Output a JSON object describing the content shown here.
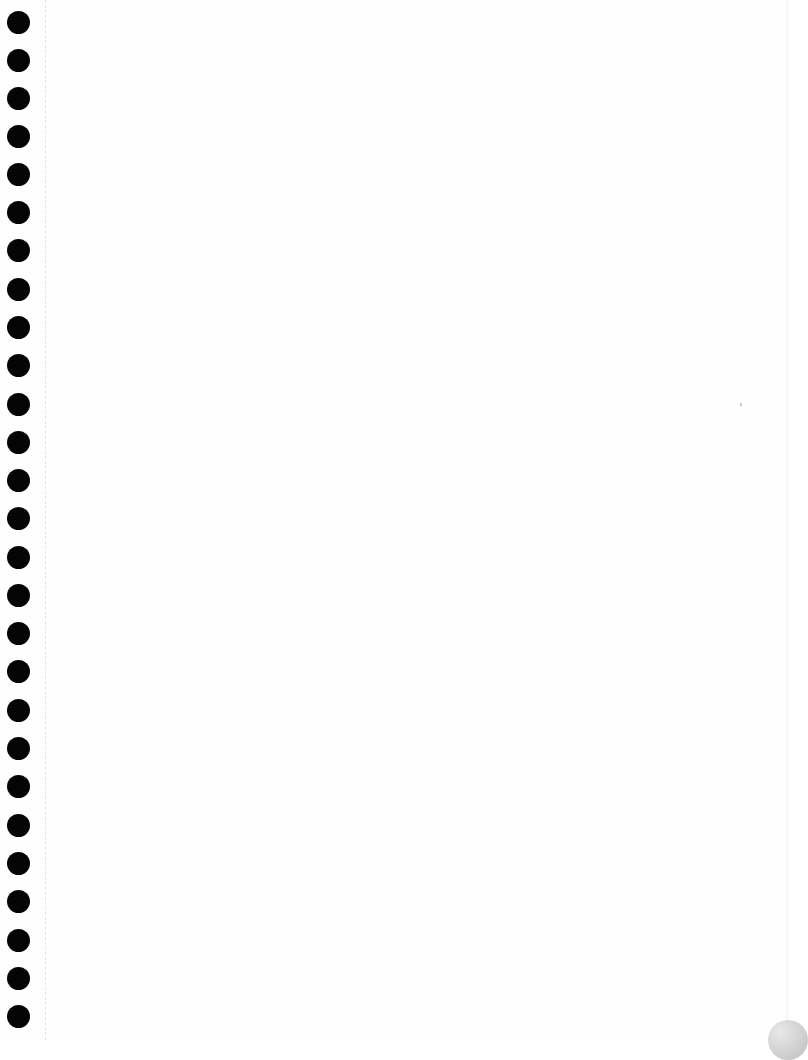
{
  "page": {
    "type": "blank notebook page",
    "background": "#fefefe",
    "hole_color": "#050505",
    "hole_count": 27,
    "hole_positions_y": [
      22,
      60,
      98,
      136,
      174,
      212,
      250,
      289,
      327,
      365,
      404,
      442,
      480,
      518,
      557,
      595,
      633,
      671,
      710,
      748,
      786,
      825,
      863,
      901,
      940,
      978,
      1016
    ],
    "margin_line_x": 45,
    "text_content": ""
  }
}
